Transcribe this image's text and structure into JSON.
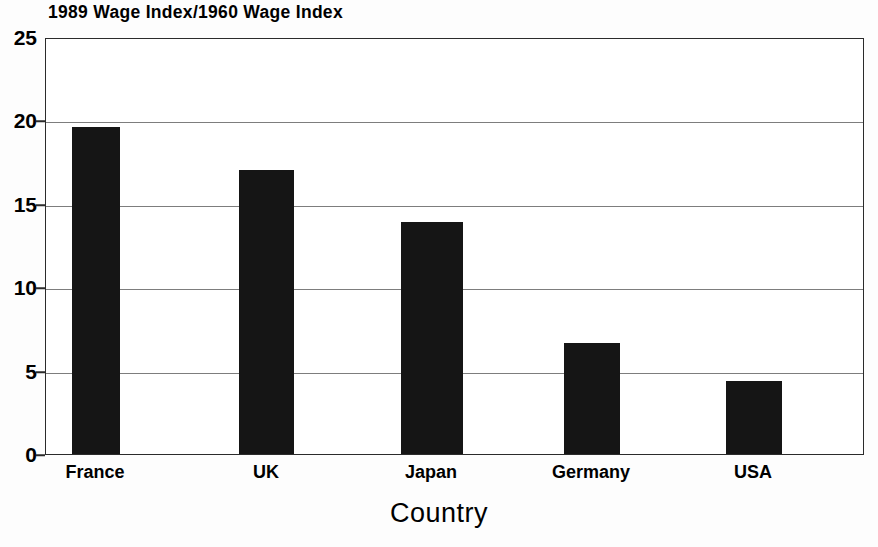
{
  "chart_data": {
    "type": "bar",
    "title": "1989 Wage Index/1960 Wage Index",
    "xlabel": "Country",
    "ylabel": "",
    "categories": [
      "France",
      "UK",
      "Japan",
      "Germany",
      "USA"
    ],
    "values": [
      19.7,
      17.1,
      14.0,
      6.7,
      4.4
    ],
    "ylim": [
      0,
      25
    ],
    "ytick_labels": [
      "0",
      "5",
      "10",
      "15",
      "20",
      "25"
    ],
    "ytick_values": [
      0,
      5,
      10,
      15,
      20,
      25
    ],
    "grid": true,
    "legend": "none",
    "bar_color": "#151515",
    "axis_color": "#2b2b2b",
    "grid_color": "#7d7d7d",
    "background_color": "#ffffff"
  },
  "axis": {
    "y_tick_0": "0",
    "y_tick_1": "5",
    "y_tick_2": "10",
    "y_tick_3": "15",
    "y_tick_4": "20",
    "y_tick_5": "25"
  },
  "categories": {
    "c0": "France",
    "c1": "UK",
    "c2": "Japan",
    "c3": "Germany",
    "c4": "USA"
  }
}
